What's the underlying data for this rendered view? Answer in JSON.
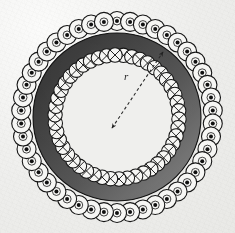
{
  "figure": {
    "background_color": "#eeeeec",
    "ink_color": "#1a1a1a"
  },
  "geometry": {
    "center_x": 117,
    "center_y": 117,
    "outer_bolt_circle_radius": 96,
    "inner_bolt_circle_radius": 62,
    "band_outer_radius": 84,
    "band_inner_radius": 66,
    "outer_bolt_head_radius": 9.5,
    "inner_bolt_head_radius": 7.2,
    "outer_bolt_count": 46,
    "inner_bolt_count": 46,
    "outer_bolt_start_angle_deg": -90,
    "inner_bolt_start_angle_deg": -84
  },
  "shading": {
    "band_dark": "#2b2b2b",
    "band_mid": "#4a4a4a",
    "band_light": "#7c7c7c",
    "band_highlight": "#9a9a9a",
    "gradient_angle_deg": 135,
    "outline": "#141414"
  },
  "symbols": {
    "outer_marker": "center-dot",
    "inner_marker": "cross-x",
    "bolt_fill": "#f6f6f4",
    "bolt_stroke": "#151515",
    "dot_fill": "#101010"
  },
  "dimension": {
    "label": "r",
    "label_x": 124,
    "label_y": 80,
    "line_style": "dashed",
    "dash_pattern": "3 2.6",
    "stroke_width": 1.1,
    "color": "#2a2a2a",
    "from_x": 112,
    "from_y": 128,
    "to_x": 163,
    "to_y": 52,
    "arrow_at_start": true,
    "arrow_at_end": true,
    "meaning": "radius to inner bolt circle"
  }
}
